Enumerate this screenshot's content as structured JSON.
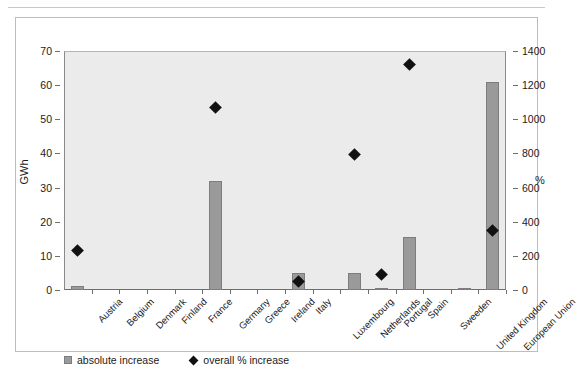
{
  "chart_data": {
    "type": "bar",
    "title": "",
    "categories": [
      "Austria",
      "Belgium",
      "Denmark",
      "Finland",
      "France",
      "Germany",
      "Greece",
      "Ireland",
      "Italy",
      "Luxembourg",
      "Netherlands",
      "Portugal",
      "Spain",
      "Sweeden",
      "United Kingdom",
      "European Union"
    ],
    "series": [
      {
        "name": "absolute increase",
        "axis": "left",
        "unit": "GWh",
        "type": "bar",
        "color": "#9a9a9a",
        "values": [
          1.2,
          0.0,
          0.0,
          0.0,
          0.0,
          32.0,
          0.0,
          0.0,
          5.0,
          0.0,
          5.0,
          0.3,
          15.5,
          0.0,
          0.7,
          61.0
        ]
      },
      {
        "name": "overall % increase",
        "axis": "right",
        "unit": "%",
        "type": "scatter",
        "marker": "diamond",
        "color": "#111111",
        "values": [
          230,
          null,
          null,
          null,
          null,
          1070,
          null,
          null,
          50,
          null,
          795,
          90,
          1320,
          null,
          null,
          350
        ]
      }
    ],
    "xlabel": "",
    "ylabel": "GWh",
    "y2label": "%",
    "ylim": [
      0,
      70
    ],
    "y2lim": [
      0,
      1400
    ],
    "yticks": [
      0,
      10,
      20,
      30,
      40,
      50,
      60,
      70
    ],
    "y2ticks": [
      0,
      200,
      400,
      600,
      800,
      1000,
      1200,
      1400
    ],
    "grid": false,
    "legend_position": "bottom-left",
    "plot_background": "#ebebeb"
  },
  "legend": {
    "entries": [
      {
        "label": "absolute increase",
        "marker": "square-swatch"
      },
      {
        "label": "overall % increase",
        "marker": "diamond-marker"
      }
    ]
  },
  "axes": {
    "left_title": "GWh",
    "right_title": "%",
    "left_ticks": [
      "70",
      "60",
      "50",
      "40",
      "30",
      "20",
      "10",
      "0"
    ],
    "right_ticks": [
      "1400",
      "1200",
      "1000",
      "800",
      "600",
      "400",
      "200",
      "0"
    ]
  }
}
